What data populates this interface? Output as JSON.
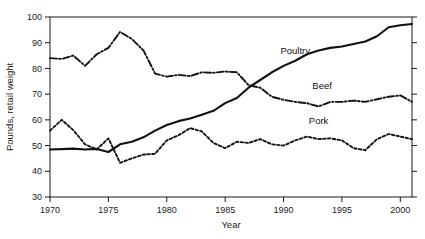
{
  "chart_data": {
    "type": "line",
    "title": "",
    "xlabel": "Year",
    "ylabel": "Pounds, retail weight",
    "xlim": [
      1970,
      2001
    ],
    "ylim": [
      30,
      100
    ],
    "ytick_labels": [
      "30",
      "40",
      "50",
      "60",
      "70",
      "80",
      "90",
      "100"
    ],
    "yticks": [
      30,
      40,
      50,
      60,
      70,
      80,
      90,
      100
    ],
    "xtick_labels": [
      "1970",
      "1975",
      "1980",
      "1985",
      "1990",
      "1995",
      "2000"
    ],
    "xticks": [
      1970,
      1975,
      1980,
      1985,
      1990,
      1995,
      2000
    ],
    "grid": false,
    "legend_position": "inline-annotations",
    "x": [
      1970,
      1971,
      1972,
      1973,
      1974,
      1975,
      1976,
      1977,
      1978,
      1979,
      1980,
      1981,
      1982,
      1983,
      1984,
      1985,
      1986,
      1987,
      1988,
      1989,
      1990,
      1991,
      1992,
      1993,
      1994,
      1995,
      1996,
      1997,
      1998,
      1999,
      2000,
      2001
    ],
    "series": [
      {
        "name": "Poultry",
        "style": "solid",
        "color": "#111111",
        "values": [
          48.5,
          48.6,
          48.8,
          48.5,
          48.7,
          47.5,
          50.5,
          51.5,
          53.2,
          55.8,
          58.0,
          59.5,
          60.5,
          62.0,
          63.5,
          66.5,
          68.5,
          72.5,
          75.5,
          78.5,
          81.0,
          83.0,
          85.5,
          87.0,
          88.0,
          88.5,
          89.5,
          90.5,
          92.5,
          96.0,
          96.8,
          97.3
        ]
      },
      {
        "name": "Beef",
        "style": "dash-dot",
        "color": "#111111",
        "values": [
          84.0,
          83.7,
          85.0,
          81.0,
          85.5,
          88.0,
          94.2,
          91.5,
          87.0,
          78.0,
          76.8,
          77.5,
          77.0,
          78.5,
          78.3,
          78.8,
          78.5,
          73.5,
          72.5,
          69.0,
          67.8,
          67.0,
          66.5,
          65.2,
          67.0,
          67.0,
          67.5,
          67.0,
          68.0,
          69.0,
          69.5,
          67.0
        ]
      },
      {
        "name": "Pork",
        "style": "dotted",
        "color": "#111111",
        "values": [
          55.8,
          60.0,
          56.0,
          50.5,
          48.5,
          52.8,
          43.3,
          45.0,
          46.5,
          46.8,
          52.0,
          54.0,
          56.8,
          55.5,
          51.0,
          49.0,
          51.5,
          51.0,
          52.5,
          50.5,
          50.0,
          52.0,
          53.5,
          52.5,
          52.8,
          52.0,
          49.0,
          48.2,
          52.5,
          54.5,
          53.5,
          52.5
        ]
      }
    ],
    "annotations": [
      {
        "text": "Poultry",
        "x": 1991.0,
        "y": 85.5
      },
      {
        "text": "Beef",
        "x": 1993.3,
        "y": 72.0
      },
      {
        "text": "Pork",
        "x": 1993.0,
        "y": 58.5
      }
    ]
  }
}
